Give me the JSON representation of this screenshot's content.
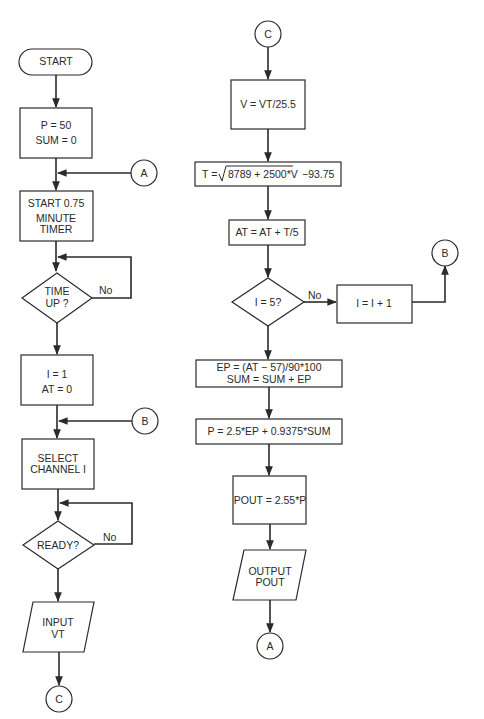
{
  "left_column": {
    "start": "START",
    "init_p": "P = 50",
    "init_sum": "SUM = 0",
    "connector_a_in": "A",
    "timer_line1": "START 0.75",
    "timer_line2": "MINUTE",
    "timer_line3": "TIMER",
    "time_up_line1": "TIME",
    "time_up_line2": "UP  ?",
    "time_up_no": "No",
    "init_i": "I = 1",
    "init_at": "AT = 0",
    "connector_b_in": "B",
    "select_line1": "SELECT",
    "select_line2": "CHANNEL I",
    "ready": "READY?",
    "ready_no": "No",
    "input_line1": "INPUT",
    "input_line2": "VT",
    "connector_c_out": "C"
  },
  "right_column": {
    "connector_c_in": "C",
    "v_calc": "V = VT/25.5",
    "t_calc_prefix": "T = ",
    "t_calc_radicand": "8789 + 2500*V",
    "t_calc_suffix": "−93.75",
    "at_calc": "AT = AT + T/5",
    "i_check": "I = 5?",
    "i_check_no": "No",
    "i_increment": "I = I + 1",
    "connector_b_out": "B",
    "ep_calc": "EP = (AT − 57)/90*100",
    "sum_calc": "SUM = SUM + EP",
    "p_calc": "P = 2.5*EP + 0.9375*SUM",
    "pout_calc": "POUT = 2.55*P",
    "output_line1": "OUTPUT",
    "output_line2": "POUT",
    "connector_a_out": "A"
  }
}
